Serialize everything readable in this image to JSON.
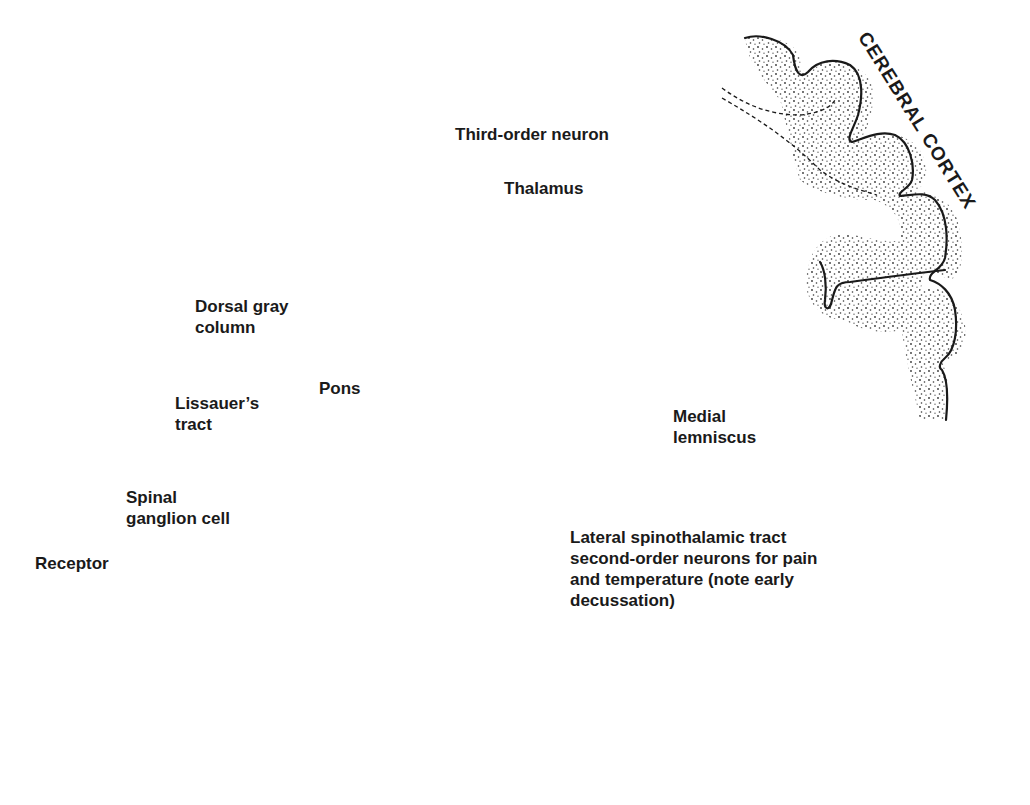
{
  "figure": {
    "type": "neuroanatomy-pathway-diagram",
    "structures": [
      "Receptor",
      "Spinal cord section",
      "Pons",
      "Thalamus",
      "Cerebral cortex"
    ]
  },
  "labels": {
    "third_order_neuron": "Third-order neuron",
    "thalamus": "Thalamus",
    "cerebral_cortex": "CEREBRAL CORTEX",
    "dorsal_gray_column": "Dorsal gray\ncolumn",
    "pons": "Pons",
    "lissauers_tract": "Lissauer’s\ntract",
    "medial_lemniscus": "Medial\nlemniscus",
    "spinal_ganglion_cell": "Spinal\nganglion cell",
    "receptor": "Receptor",
    "lateral_spinothalamic": "Lateral spinothalamic tract\nsecond-order neurons for pain\nand temperature (note early\ndecussation)"
  },
  "colors": {
    "ink": "#1a1a1a",
    "paper": "#ffffff"
  }
}
